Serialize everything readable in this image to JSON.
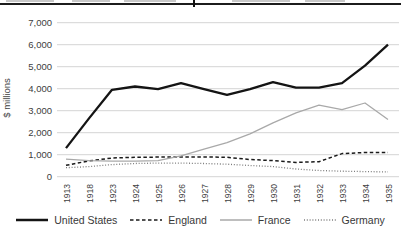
{
  "chart_data": {
    "type": "line",
    "title": "",
    "xlabel": "",
    "ylabel": "$ millions",
    "ylim": [
      0,
      7000
    ],
    "ytick_step": 1000,
    "ytick_labels": [
      "7,000",
      "6,000",
      "5,000",
      "4,000",
      "3,000",
      "2,000",
      "1,000",
      "0"
    ],
    "grid": true,
    "legend_position": "bottom",
    "categories": [
      "1913",
      "1918",
      "1923",
      "1924",
      "1925",
      "1926",
      "1927",
      "1928",
      "1929",
      "1930",
      "1931",
      "1932",
      "1933",
      "1934",
      "1935"
    ],
    "series": [
      {
        "name": "United States",
        "color": "#141414",
        "style": "solid",
        "values": [
          1300,
          2650,
          3950,
          4100,
          3980,
          4250,
          3980,
          3720,
          3980,
          4300,
          4050,
          4050,
          4250,
          5050,
          6000
        ]
      },
      {
        "name": "England",
        "color": "#1a1a1a",
        "style": "dashed",
        "values": [
          520,
          720,
          850,
          880,
          890,
          890,
          900,
          880,
          780,
          730,
          650,
          680,
          1050,
          1100,
          1100
        ]
      },
      {
        "name": "France",
        "color": "#a9a9a9",
        "style": "solid",
        "values": [
          800,
          730,
          710,
          710,
          730,
          950,
          1250,
          1550,
          1950,
          2450,
          2900,
          3250,
          3050,
          3350,
          2600
        ]
      },
      {
        "name": "Germany",
        "color": "#7d7d7d",
        "style": "dotted",
        "values": [
          410,
          460,
          550,
          600,
          620,
          620,
          600,
          570,
          510,
          460,
          350,
          280,
          250,
          230,
          220
        ]
      }
    ]
  }
}
